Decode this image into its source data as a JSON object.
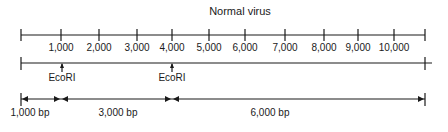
{
  "title": "Normal virus",
  "ruler": {
    "tick_labels": [
      "1,000",
      "2,000",
      "3,000",
      "4,000",
      "5,000",
      "6,000",
      "7,000",
      "8,000",
      "9,000",
      "10,000"
    ],
    "tick_x": [
      21,
      61,
      99,
      137,
      172,
      209,
      245,
      285,
      324,
      358,
      394,
      425
    ],
    "label_x": [
      61,
      99,
      137,
      172,
      209,
      245,
      285,
      324,
      358,
      394
    ]
  },
  "genome_line": {
    "sites": [
      {
        "label": "EcoRI",
        "position": 1000,
        "x": 62
      },
      {
        "label": "EcoRI",
        "position": 4000,
        "x": 172
      }
    ]
  },
  "fragments": [
    {
      "label": "1,000 bp",
      "x_start": 21,
      "x_end": 61,
      "label_x": 30
    },
    {
      "label": "3,000 bp",
      "x_start": 61,
      "x_end": 172,
      "label_x": 118
    },
    {
      "label": "6,000 bp",
      "x_start": 172,
      "x_end": 425,
      "label_x": 270
    }
  ]
}
